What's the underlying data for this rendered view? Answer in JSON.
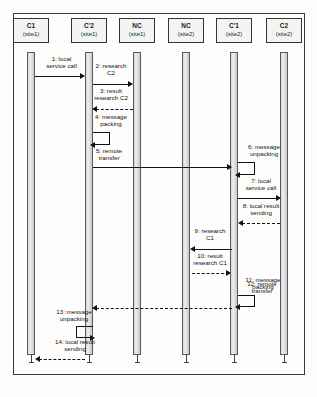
{
  "diagram": {
    "type": "uml-sequence-diagram",
    "participants": [
      {
        "id": "c1",
        "name": "C1",
        "site": "(site1)",
        "x": 30
      },
      {
        "id": "cp2",
        "name": "C'2",
        "site": "(site1)",
        "x": 88
      },
      {
        "id": "nc1",
        "name": "NC",
        "site": "(site1)",
        "x": 136
      },
      {
        "id": "nc2",
        "name": "NC",
        "site": "(site2)",
        "x": 185
      },
      {
        "id": "cp1",
        "name": "C'1",
        "site": "(site2)",
        "x": 233
      },
      {
        "id": "c2",
        "name": "C2",
        "site": "(site2)",
        "x": 283
      }
    ],
    "messages": [
      {
        "num": "1",
        "label": "1: local\nservice call",
        "from": "c1",
        "to": "cp2",
        "style": "solid",
        "y": 73
      },
      {
        "num": "2",
        "label": "2: research\nC2",
        "from": "cp2",
        "to": "nc1",
        "style": "solid",
        "y": 93
      },
      {
        "num": "3",
        "label": "3: result\nresearch C2",
        "from": "nc1",
        "to": "cp2",
        "style": "dashed",
        "y": 113
      },
      {
        "num": "4",
        "label": "4: message\npacking",
        "from": "cp2",
        "to": "cp2",
        "style": "self",
        "y": 130
      },
      {
        "num": "5",
        "label": "5: remote\ntransfer",
        "from": "cp2",
        "to": "cp1",
        "style": "solid",
        "y": 164
      },
      {
        "num": "6",
        "label": "6: message\nunpacking",
        "from": "cp1",
        "to": "cp1",
        "style": "self",
        "y": 160
      },
      {
        "num": "7",
        "label": "7: local\nservice call",
        "from": "cp1",
        "to": "c2",
        "style": "solid",
        "y": 199
      },
      {
        "num": "8",
        "label": "8: local result\nsending",
        "from": "c2",
        "to": "cp1",
        "style": "dashed",
        "y": 224
      },
      {
        "num": "9",
        "label": "9: research\nC1",
        "from": "cp1",
        "to": "nc2",
        "style": "solid",
        "y": 239
      },
      {
        "num": "10",
        "label": "10: result\nresearch C1",
        "from": "nc2",
        "to": "cp1",
        "style": "dashed",
        "y": 263
      },
      {
        "num": "11",
        "label": "11: message\npacking",
        "from": "cp1",
        "to": "cp1",
        "style": "self",
        "y": 275
      },
      {
        "num": "12",
        "label": "12: remote\ntransfer",
        "from": "cp1",
        "to": "cp2",
        "style": "dashed",
        "y": 305
      },
      {
        "num": "13",
        "label": "13: message\nunpacking",
        "from": "cp2",
        "to": "cp2",
        "style": "self",
        "y": 310
      },
      {
        "num": "14",
        "label": "14: local result\nsending",
        "from": "cp2",
        "to": "c1",
        "style": "dashed",
        "y": 352
      }
    ],
    "colors": {
      "frame_border": "#3a3a3a",
      "box_border": "#333333",
      "box_fill": "#f4f4f4",
      "activation_fill": "#dcdcdc",
      "line": "#111111",
      "background": "#fefefe"
    }
  }
}
